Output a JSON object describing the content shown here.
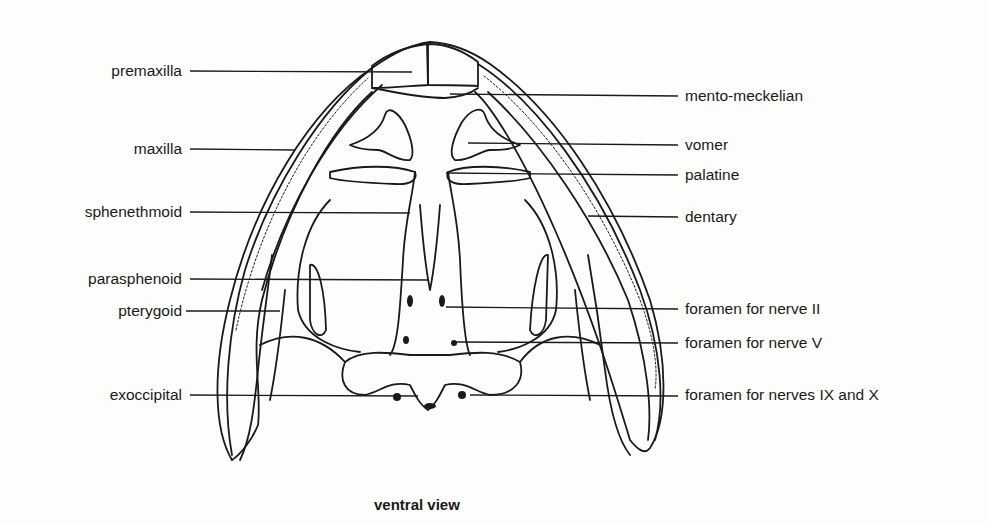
{
  "diagram": {
    "caption": "ventral view",
    "colors": {
      "line": "#1a1a1a",
      "background": "#fdfdfc"
    },
    "labels_left": [
      {
        "text": "premaxilla",
        "x": 182,
        "y": 71,
        "line_to_x": 412
      },
      {
        "text": "maxilla",
        "x": 182,
        "y": 149,
        "line_to_x": 295
      },
      {
        "text": "sphenethmoid",
        "x": 182,
        "y": 212,
        "line_to_x": 410
      },
      {
        "text": "parasphenoid",
        "x": 182,
        "y": 279,
        "line_to_x": 429
      },
      {
        "text": "pterygoid",
        "x": 182,
        "y": 311,
        "line_to_x": 280
      },
      {
        "text": "exoccipital",
        "x": 182,
        "y": 395,
        "line_to_x": 418
      }
    ],
    "labels_right": [
      {
        "text": "mento-meckelian",
        "x": 685,
        "y": 95,
        "line_from_x": 450
      },
      {
        "text": "vomer",
        "x": 685,
        "y": 144,
        "line_from_x": 468
      },
      {
        "text": "palatine",
        "x": 685,
        "y": 175,
        "line_from_x": 446
      },
      {
        "text": "dentary",
        "x": 685,
        "y": 217,
        "line_from_x": 588
      },
      {
        "text": "foramen for nerve II",
        "x": 685,
        "y": 309,
        "line_from_x": 446
      },
      {
        "text": "foramen for nerve V",
        "x": 685,
        "y": 343,
        "line_from_x": 456
      },
      {
        "text": "foramen for nerves IX and X",
        "x": 685,
        "y": 395,
        "line_from_x": 470
      }
    ]
  }
}
